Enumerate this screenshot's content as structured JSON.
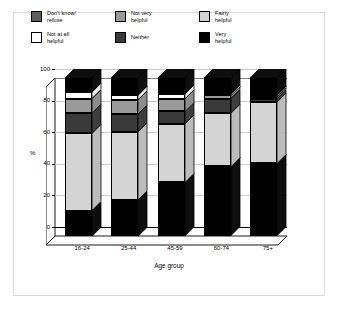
{
  "chart_data": {
    "type": "bar",
    "subtype": "stacked-3d-column",
    "title": "",
    "xlabel": "Age group",
    "ylabel": "%",
    "ylim": [
      0,
      100
    ],
    "yticks": [
      "0",
      "20",
      "40",
      "60",
      "80",
      "100"
    ],
    "grid": true,
    "legend_position": "top",
    "categories": [
      "16-24",
      "25-44",
      "45-59",
      "60-74",
      "75+"
    ],
    "series": [
      {
        "name": "Very helpful",
        "key": "very",
        "color": "#000000",
        "values": [
          16,
          23,
          34,
          44,
          46
        ]
      },
      {
        "name": "Fairly helpful",
        "key": "fairly",
        "color": "#d4d4d4",
        "values": [
          49,
          43,
          37,
          34,
          39
        ]
      },
      {
        "name": "Neither",
        "key": "neither",
        "color": "#3a3a3a",
        "values": [
          13,
          11,
          8,
          9,
          2
        ]
      },
      {
        "name": "Not very helpful",
        "key": "notvery",
        "color": "#9a9a9a",
        "values": [
          9,
          9,
          8,
          2,
          1
        ]
      },
      {
        "name": "Not at all helpful",
        "key": "notatall",
        "color": "#ffffff",
        "values": [
          4,
          3,
          3,
          1,
          1
        ]
      },
      {
        "name": "Don't know/ refuse",
        "key": "dontknow",
        "color": "#000000",
        "values": [
          9,
          11,
          10,
          10,
          11
        ]
      }
    ]
  },
  "legend": {
    "items": [
      {
        "label": "Don't know/\nrefuse",
        "color": "#5e5e5e"
      },
      {
        "label": "Not very\nhelpful",
        "color": "#9a9a9a"
      },
      {
        "label": "Fairly\nhelpful",
        "color": "#d4d4d4"
      },
      {
        "label": "Not at all\nhelpful",
        "color": "#ffffff"
      },
      {
        "label": "Neither",
        "color": "#3a3a3a"
      },
      {
        "label": "Very\nhelpful",
        "color": "#000000"
      }
    ]
  },
  "axes": {
    "y_title": "%",
    "x_title": "Age group",
    "y_ticks": [
      "100",
      "80",
      "60",
      "40",
      "20",
      "0"
    ],
    "x_ticks": [
      "16-24",
      "25-44",
      "45-59",
      "60-74",
      "75+"
    ]
  }
}
